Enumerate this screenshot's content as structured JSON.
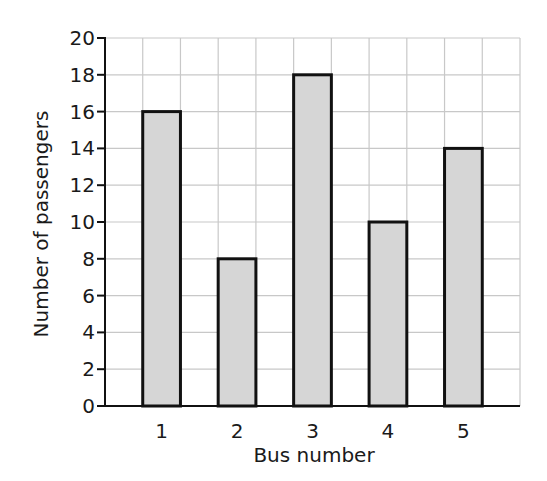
{
  "chart_data": {
    "type": "bar",
    "title": "",
    "xlabel": "Bus number",
    "ylabel": "Number of passengers",
    "categories": [
      "1",
      "2",
      "3",
      "4",
      "5"
    ],
    "values": [
      16,
      8,
      18,
      10,
      14
    ],
    "ylim": [
      0,
      20
    ],
    "yticks": [
      0,
      2,
      4,
      6,
      8,
      10,
      12,
      14,
      16,
      18,
      20
    ],
    "grid": true,
    "legend": null,
    "colors": {
      "bar_fill": "#d6d6d6",
      "bar_stroke": "#111111",
      "grid": "#c8c8c8",
      "axis": "#111111"
    }
  }
}
